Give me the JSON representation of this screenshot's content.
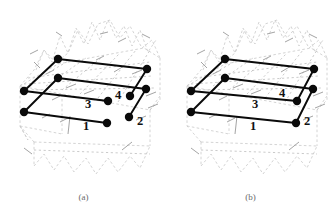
{
  "figure": {
    "panels": [
      {
        "id": "a",
        "caption": "(a)",
        "labels": [
          {
            "text": "1",
            "x": 86,
            "y": 130
          },
          {
            "text": "2",
            "x": 140,
            "y": 125
          },
          {
            "text": "3",
            "x": 88,
            "y": 108
          },
          {
            "text": "4",
            "x": 118,
            "y": 99
          }
        ],
        "nodes": [
          {
            "id": "n1",
            "x": 58,
            "y": 59,
            "r": 4.2
          },
          {
            "id": "n2",
            "x": 147,
            "y": 69,
            "r": 4.2
          },
          {
            "id": "n3",
            "x": 58,
            "y": 78,
            "r": 4.2
          },
          {
            "id": "n4",
            "x": 146,
            "y": 89,
            "r": 4.2
          },
          {
            "id": "n5",
            "x": 24,
            "y": 91,
            "r": 4.2
          },
          {
            "id": "n6",
            "x": 130,
            "y": 96,
            "r": 4.2
          },
          {
            "id": "n7",
            "x": 108,
            "y": 101,
            "r": 4.2
          },
          {
            "id": "n8",
            "x": 24,
            "y": 112,
            "r": 4.2
          },
          {
            "id": "n9",
            "x": 129,
            "y": 117,
            "r": 4.2
          },
          {
            "id": "n10",
            "x": 107,
            "y": 123,
            "r": 4.2
          }
        ],
        "edges": [
          {
            "from": "n1",
            "to": "n2"
          },
          {
            "from": "n3",
            "to": "n4"
          },
          {
            "from": "n5",
            "to": "n7"
          },
          {
            "from": "n8",
            "to": "n10"
          },
          {
            "from": "n1",
            "to": "n5"
          },
          {
            "from": "n3",
            "to": "n8"
          },
          {
            "from": "n2",
            "to": "n6"
          },
          {
            "from": "n4",
            "to": "n9"
          }
        ]
      },
      {
        "id": "b",
        "caption": "(b)",
        "labels": [
          {
            "text": "1",
            "x": 86,
            "y": 130
          },
          {
            "text": "2",
            "x": 140,
            "y": 125
          },
          {
            "text": "3",
            "x": 88,
            "y": 108
          },
          {
            "text": "4",
            "x": 115,
            "y": 97
          }
        ],
        "nodes": [
          {
            "id": "n1",
            "x": 58,
            "y": 59,
            "r": 4.2
          },
          {
            "id": "n2",
            "x": 147,
            "y": 69,
            "r": 4.2
          },
          {
            "id": "n3",
            "x": 58,
            "y": 78,
            "r": 4.2
          },
          {
            "id": "n4",
            "x": 146,
            "y": 89,
            "r": 4.2
          },
          {
            "id": "n5",
            "x": 24,
            "y": 91,
            "r": 4.2
          },
          {
            "id": "n6",
            "x": 130,
            "y": 101,
            "r": 4.2
          },
          {
            "id": "n8",
            "x": 24,
            "y": 112,
            "r": 4.2
          },
          {
            "id": "n9",
            "x": 129,
            "y": 123,
            "r": 4.2
          }
        ],
        "edges": [
          {
            "from": "n1",
            "to": "n2"
          },
          {
            "from": "n3",
            "to": "n4"
          },
          {
            "from": "n5",
            "to": "n6"
          },
          {
            "from": "n8",
            "to": "n9"
          },
          {
            "from": "n1",
            "to": "n5"
          },
          {
            "from": "n3",
            "to": "n8"
          },
          {
            "from": "n2",
            "to": "n6"
          },
          {
            "from": "n4",
            "to": "n9"
          }
        ]
      }
    ],
    "background": {
      "description": "light-gray dashed 3d prism with jagged zigzag top and bottom faces",
      "color": "#c9c9c9"
    }
  }
}
